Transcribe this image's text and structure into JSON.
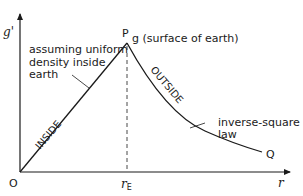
{
  "diagram": {
    "title": "",
    "y_axis_label": "g'",
    "x_axis_label": "r",
    "origin_label": "O",
    "peak_label": "P",
    "peak_annotation": "g (surface of earth)",
    "end_label": "Q",
    "x_marker_label": "r",
    "x_marker_subscript": "E",
    "inside_label": "INSIDE",
    "outside_label": "OUTSIDE",
    "inside_note": [
      "assuming uniform",
      "density inside",
      "earth"
    ],
    "outside_note": [
      "inverse-square",
      "law"
    ],
    "colors": {
      "ink": "#1a1a1a",
      "background": "#ffffff"
    }
  }
}
